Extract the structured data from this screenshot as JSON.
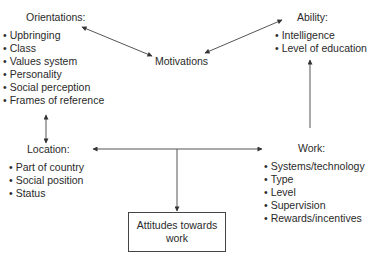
{
  "orientations": {
    "title": "Orientations:",
    "items": [
      "Upbringing",
      "Class",
      "Values system",
      "Personality",
      "Social perception",
      "Frames of reference"
    ]
  },
  "motivations": {
    "title": "Motivations"
  },
  "ability": {
    "title": "Ability:",
    "items": [
      "Intelligence",
      "Level of education"
    ]
  },
  "location": {
    "title": "Location:",
    "items": [
      "Part of country",
      "Social position",
      "Status"
    ]
  },
  "work": {
    "title": "Work:",
    "items": [
      "Systems/technology",
      "Type",
      "Level",
      "Supervision",
      "Rewards/incentives"
    ]
  },
  "outcome": {
    "label": "Attitudes towards work"
  },
  "colors": {
    "line": "#444444",
    "text": "#2a2a2a"
  }
}
